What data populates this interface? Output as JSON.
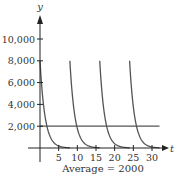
{
  "chart_data": {
    "type": "line",
    "title": "",
    "xlabel": "t",
    "ylabel": "y",
    "caption": "Average = 2000",
    "xlim": [
      0,
      32
    ],
    "ylim": [
      0,
      11000
    ],
    "x_ticks": [
      5,
      10,
      15,
      20,
      25,
      30
    ],
    "x_tick_labels": [
      "5",
      "10",
      "15",
      "20",
      "25",
      "30"
    ],
    "y_ticks": [
      2000,
      4000,
      6000,
      8000,
      10000
    ],
    "y_tick_labels": [
      "2,000",
      "4,000",
      "6,000",
      "8,000",
      "10,000"
    ],
    "grid": false,
    "legend": null,
    "series": [
      {
        "name": "dose-decay",
        "description": "Repeated exponential decay curves, each starting at 8000 and decaying toward 0, restarting every 8 units",
        "peak_value": 8000,
        "period": 8,
        "pulse_starts": [
          0,
          8,
          16,
          24
        ],
        "decay_rate": 0.75,
        "color": "#555555"
      },
      {
        "name": "average",
        "description": "Horizontal line at the average value",
        "value": 2000,
        "x_range": [
          0,
          32
        ],
        "color": "#555555"
      }
    ]
  },
  "colors": {
    "axis": "#222222",
    "curve": "#555555",
    "text": "#333333",
    "background": "#ffffff"
  }
}
